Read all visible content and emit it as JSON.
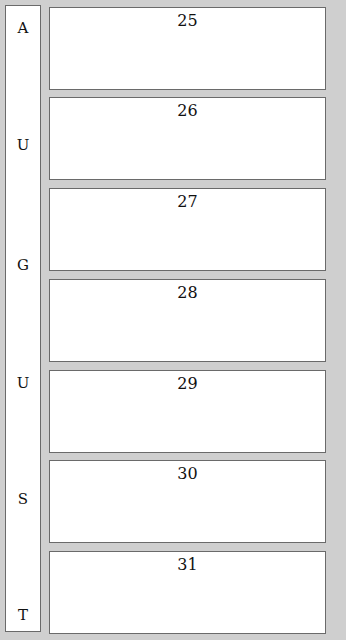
{
  "month": {
    "name": "AUGUST",
    "letters": [
      "A",
      "U",
      "G",
      "U",
      "S",
      "T"
    ]
  },
  "days": [
    {
      "number": "25"
    },
    {
      "number": "26"
    },
    {
      "number": "27"
    },
    {
      "number": "28"
    },
    {
      "number": "29"
    },
    {
      "number": "30"
    },
    {
      "number": "31"
    }
  ]
}
